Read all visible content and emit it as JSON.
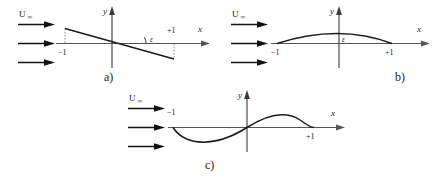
{
  "figure": {
    "background_color": "#ffffff",
    "line_color": "#1a1a1a",
    "axis_color": "#555555",
    "width": 440,
    "height": 182
  },
  "common": {
    "flow_label_main": "U",
    "flow_label_sub": "∞",
    "y_axis_label": "y",
    "x_axis_label": "x",
    "tick_minus_one": "−1",
    "tick_plus_one": "+1",
    "epsilon_label": "ε",
    "stream_arrow_count": 3
  },
  "panels": [
    {
      "id": "a",
      "caption": "a)",
      "shape": "inclined-flat-plate",
      "description": "Straight flat plate inclined at angle epsilon to the free stream, descending from left to right",
      "has_epsilon_angle_arc": true,
      "has_dashed_guides": true,
      "y_axis_label": "y",
      "x_axis_label": "x",
      "tick_left": "−1",
      "tick_right": "+1",
      "epsilon_label": "ε",
      "flow_label_main": "U",
      "flow_label_sub": "∞"
    },
    {
      "id": "b",
      "caption": "b)",
      "shape": "circular-arc-camber",
      "description": "Symmetric circular-arc camber line bulging upward between minus one and plus one",
      "has_epsilon_angle_arc": false,
      "has_dashed_guides": false,
      "y_axis_label": "y",
      "x_axis_label": "x",
      "tick_left": "−1",
      "tick_right": "+1",
      "epsilon_label": "ε",
      "flow_label_main": "U",
      "flow_label_sub": "∞"
    },
    {
      "id": "c",
      "caption": "c)",
      "shape": "s-shaped-camber",
      "description": "S-shaped (reflex) camber line dipping below the axis on the forward half and rising above it on the aft half",
      "has_epsilon_angle_arc": false,
      "has_dashed_guides": false,
      "y_axis_label": "y",
      "x_axis_label": "x",
      "tick_left": "−1",
      "tick_right": "+1",
      "epsilon_label": "",
      "flow_label_main": "U",
      "flow_label_sub": "∞"
    }
  ]
}
